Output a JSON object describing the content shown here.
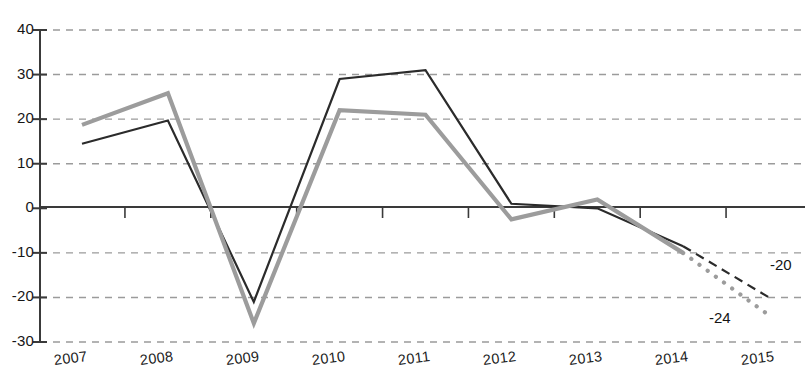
{
  "chart_data": {
    "type": "line",
    "title": "",
    "subtitle": "",
    "xlabel": "",
    "ylabel": "",
    "x": [
      "2007",
      "2008",
      "2009",
      "2010",
      "2011",
      "2012",
      "2013",
      "2014",
      "2015"
    ],
    "categories": [
      "2007",
      "2008",
      "2009",
      "2010",
      "2011",
      "2012",
      "2013",
      "2014",
      "2015"
    ],
    "ytick_labels": [
      "40",
      "30",
      "20",
      "10",
      "0",
      "-10",
      "-20",
      "-30"
    ],
    "ytick_values": [
      40,
      30,
      20,
      10,
      0,
      -10,
      -20,
      -30
    ],
    "ylim": [
      -30,
      40
    ],
    "grid": "horizontal-dashed",
    "legend": "none",
    "legend_position": "none",
    "zero_line": 0,
    "series": [
      {
        "name": "dark-series",
        "color": "#2b2b2b",
        "solid_through": "2014",
        "forecast_style": "dashed",
        "values": [
          14.5,
          19.7,
          -21.0,
          29.0,
          31.0,
          1.0,
          0.0,
          -8.5,
          -20.0
        ],
        "end_label": "-20"
      },
      {
        "name": "gray-series",
        "color": "#9c9c9c",
        "solid_through": "2014",
        "forecast_style": "dotted",
        "values": [
          18.7,
          25.8,
          -25.8,
          22.0,
          21.0,
          -2.5,
          2.0,
          -10.0,
          -24.0
        ],
        "end_label": "-24"
      }
    ],
    "annotations": [
      {
        "text": "-20",
        "x_px": 770,
        "y_px": 256,
        "color": "#141414"
      },
      {
        "text": "-24",
        "x_px": 709,
        "y_px": 309,
        "color": "#141414"
      }
    ]
  },
  "axes": {
    "y_axis_top_value": 40,
    "y_axis_bottom_value": -30,
    "x_tick_count": 8
  }
}
